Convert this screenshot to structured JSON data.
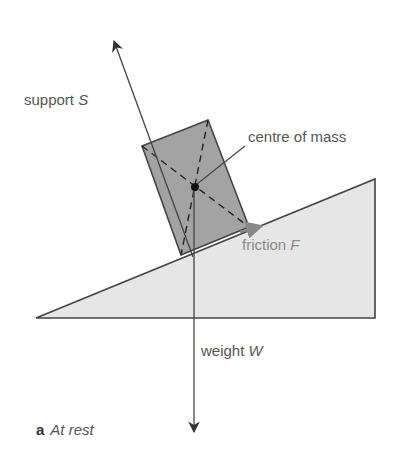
{
  "diagram": {
    "labels": {
      "support": {
        "text": "support",
        "symbol": "S"
      },
      "centre_of_mass": {
        "text": "centre of mass"
      },
      "friction": {
        "text": "friction",
        "symbol": "F"
      },
      "weight": {
        "text": "weight",
        "symbol": "W"
      }
    },
    "caption": {
      "letter": "a",
      "text": "At rest"
    },
    "colors": {
      "block_fill": "#a3a3a3",
      "slope_fill": "#e6e6e6",
      "lines": "#444444",
      "friction_arrow": "#888888"
    }
  }
}
